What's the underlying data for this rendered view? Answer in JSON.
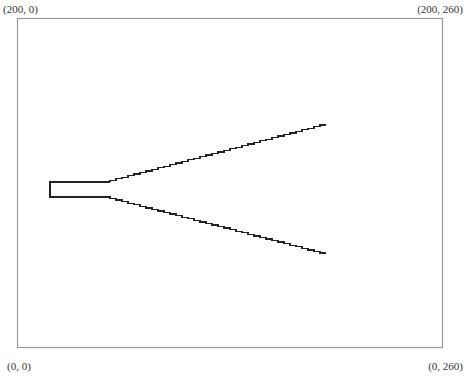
{
  "diagram": {
    "type": "waveguide-horn-outline",
    "corner_labels": {
      "top_left": "(200, 0)",
      "top_right": "(200, 260)",
      "bottom_left": "(0, 0)",
      "bottom_right": "(0, 260)"
    },
    "frame": {
      "x": 17,
      "y": 18,
      "width": 425,
      "height": 329,
      "stroke": "#9a9a9a"
    },
    "shape": {
      "stroke": "#222222",
      "feed_rect": {
        "left": 50,
        "top": 182,
        "right": 110,
        "bottom": 197
      },
      "upper_flare": {
        "start": [
          110,
          182
        ],
        "end": [
          326,
          125
        ],
        "steps": 36
      },
      "lower_flare": {
        "start": [
          110,
          197
        ],
        "end": [
          326,
          253
        ],
        "steps": 36
      }
    }
  }
}
